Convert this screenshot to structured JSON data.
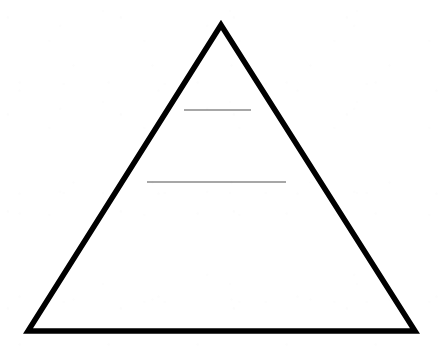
{
  "document": {
    "title": "Pyramid Diagram",
    "kind": "blank-pyramid-worksheet",
    "width": 441,
    "height": 351,
    "background_color": "#ffffff"
  },
  "diagram": {
    "name": "pyramid",
    "outline_color": "#000000",
    "outline_width": 5.5,
    "fill_color": "#ffffff",
    "apex": {
      "x": 221,
      "y": 25
    },
    "bottom_left": {
      "x": 28,
      "y": 331
    },
    "bottom_right": {
      "x": 415,
      "y": 331
    },
    "divider_color": "#8a8a8a",
    "divider_width": 1.5,
    "dividers": [
      {
        "name": "upper-divider",
        "x1": 184,
        "x2": 251,
        "y": 110
      },
      {
        "name": "lower-divider",
        "x1": 147,
        "x2": 286,
        "y": 182
      }
    ],
    "tiers": [
      {
        "name": "top-tier",
        "label": ""
      },
      {
        "name": "middle-tier",
        "label": ""
      },
      {
        "name": "bottom-tier",
        "label": ""
      }
    ]
  }
}
